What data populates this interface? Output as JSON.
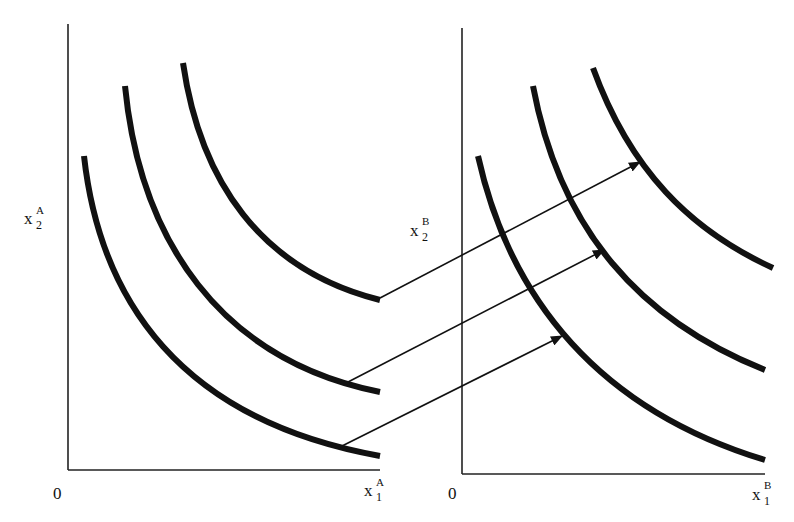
{
  "diagram": {
    "type": "indifference-curve-mapping",
    "panels": [
      {
        "id": "A",
        "origin_label": "0",
        "x_axis_label": {
          "base": "x",
          "sup": "A",
          "sub": "1"
        },
        "y_axis_label": {
          "base": "x",
          "sup": "A",
          "sub": "2"
        },
        "curve_count": 3
      },
      {
        "id": "B",
        "origin_label": "0",
        "x_axis_label": {
          "base": "x",
          "sup": "B",
          "sub": "1"
        },
        "y_axis_label": {
          "base": "x",
          "sup": "B",
          "sub": "2"
        },
        "curve_count": 3
      }
    ],
    "arrows": [
      {
        "from": "panel A top curve",
        "to": "panel B top curve"
      },
      {
        "from": "panel A middle curve",
        "to": "panel B middle curve"
      },
      {
        "from": "panel A bottom curve",
        "to": "panel B bottom curve"
      }
    ],
    "colors": {
      "ink": "#111111",
      "background": "#ffffff"
    }
  }
}
